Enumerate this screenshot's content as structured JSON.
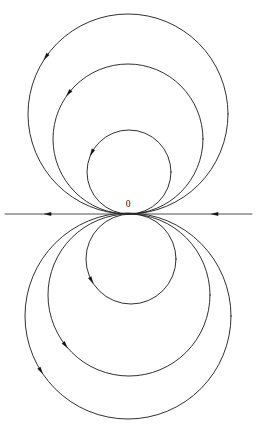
{
  "figure": {
    "background_color": "#ffffff",
    "stroke_color": "#1a1a1a",
    "axis_color": "#3a3a3a",
    "width": 256,
    "height": 424,
    "origin_label": "0",
    "origin": {
      "x": 128,
      "y": 214
    },
    "origin_label_position": {
      "x": 128,
      "y": 205
    }
  },
  "chart_data": {
    "type": "line",
    "xlabel": "",
    "ylabel": "",
    "grid": false,
    "legend": "none",
    "annotations": [
      {
        "text": "0",
        "x": 128,
        "y": 205
      }
    ],
    "axis": {
      "name": "horizontal-axis",
      "y": 214,
      "x_start": 5,
      "x_end": 252,
      "arrow_direction": "left",
      "arrow_positions": [
        48,
        215
      ]
    },
    "series": [
      {
        "name": "upper-circle-small",
        "half": "upper",
        "center_x": 129,
        "center_y": 172,
        "radius": 42,
        "arrow_angle_deg": 208,
        "arrow_direction": "counterclockwise"
      },
      {
        "name": "upper-circle-medium",
        "half": "upper",
        "center_x": 128,
        "center_y": 139,
        "radius": 75,
        "arrow_angle_deg": 218,
        "arrow_direction": "counterclockwise"
      },
      {
        "name": "upper-circle-large",
        "half": "upper",
        "center_x": 128,
        "center_y": 114,
        "radius": 100,
        "arrow_angle_deg": 215,
        "arrow_direction": "counterclockwise"
      },
      {
        "name": "lower-circle-small",
        "half": "lower",
        "center_x": 131,
        "center_y": 259,
        "radius": 45,
        "arrow_angle_deg": 152,
        "arrow_direction": "counterclockwise"
      },
      {
        "name": "lower-circle-medium",
        "half": "lower",
        "center_x": 129,
        "center_y": 295,
        "radius": 81,
        "arrow_angle_deg": 142,
        "arrow_direction": "counterclockwise"
      },
      {
        "name": "lower-circle-large",
        "half": "lower",
        "center_x": 128,
        "center_y": 316,
        "radius": 103,
        "arrow_angle_deg": 148,
        "arrow_direction": "counterclockwise"
      }
    ]
  }
}
